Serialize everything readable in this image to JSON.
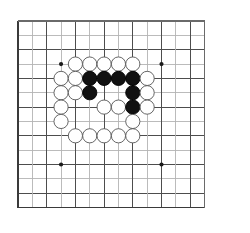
{
  "figure": {
    "kind": "go-board-diagram",
    "caption": "",
    "background_color": "#ffffff"
  },
  "board": {
    "name": "go-board",
    "columns": 14,
    "rows": 14,
    "origin_x": 18,
    "origin_y": 21,
    "spacing": 14.35,
    "line_color_major": "#4d4d4d",
    "line_color_minor": "#b4b4b4",
    "border_color": "#3a3a3a",
    "line_width_major": 1.0,
    "line_width_minor": 0.9,
    "border_width": 1.6,
    "star_point_color": "#1a1a1a",
    "star_point_radius": 2.1,
    "star_points": [
      {
        "col": 3,
        "row": 3
      },
      {
        "col": 10,
        "row": 3
      },
      {
        "col": 3,
        "row": 10
      },
      {
        "col": 10,
        "row": 10
      }
    ],
    "dark_columns": [
      0,
      2,
      4,
      6,
      8,
      10,
      12
    ],
    "dark_rows": [
      0,
      2,
      4,
      6,
      8,
      10,
      12
    ]
  },
  "stones": {
    "radius": 7.1,
    "black_fill": "#111111",
    "black_stroke": "#000000",
    "white_fill": "#ffffff",
    "white_stroke": "#555555",
    "stroke_width": 0.9,
    "items": [
      {
        "col": 4,
        "row": 3,
        "color": "white"
      },
      {
        "col": 5,
        "row": 3,
        "color": "white"
      },
      {
        "col": 6,
        "row": 3,
        "color": "white"
      },
      {
        "col": 7,
        "row": 3,
        "color": "white"
      },
      {
        "col": 8,
        "row": 3,
        "color": "white"
      },
      {
        "col": 3,
        "row": 4,
        "color": "white"
      },
      {
        "col": 4,
        "row": 4,
        "color": "white"
      },
      {
        "col": 5,
        "row": 4,
        "color": "black"
      },
      {
        "col": 6,
        "row": 4,
        "color": "black"
      },
      {
        "col": 7,
        "row": 4,
        "color": "black"
      },
      {
        "col": 8,
        "row": 4,
        "color": "black"
      },
      {
        "col": 9,
        "row": 4,
        "color": "white"
      },
      {
        "col": 3,
        "row": 5,
        "color": "white"
      },
      {
        "col": 4,
        "row": 5,
        "color": "white"
      },
      {
        "col": 5,
        "row": 5,
        "color": "black"
      },
      {
        "col": 8,
        "row": 5,
        "color": "black"
      },
      {
        "col": 9,
        "row": 5,
        "color": "white"
      },
      {
        "col": 3,
        "row": 6,
        "color": "white"
      },
      {
        "col": 6,
        "row": 6,
        "color": "white"
      },
      {
        "col": 7,
        "row": 6,
        "color": "white"
      },
      {
        "col": 8,
        "row": 6,
        "color": "black"
      },
      {
        "col": 9,
        "row": 6,
        "color": "white"
      },
      {
        "col": 3,
        "row": 7,
        "color": "white"
      },
      {
        "col": 8,
        "row": 7,
        "color": "white"
      },
      {
        "col": 4,
        "row": 8,
        "color": "white"
      },
      {
        "col": 5,
        "row": 8,
        "color": "white"
      },
      {
        "col": 6,
        "row": 8,
        "color": "white"
      },
      {
        "col": 7,
        "row": 8,
        "color": "white"
      },
      {
        "col": 8,
        "row": 8,
        "color": "white"
      }
    ]
  }
}
